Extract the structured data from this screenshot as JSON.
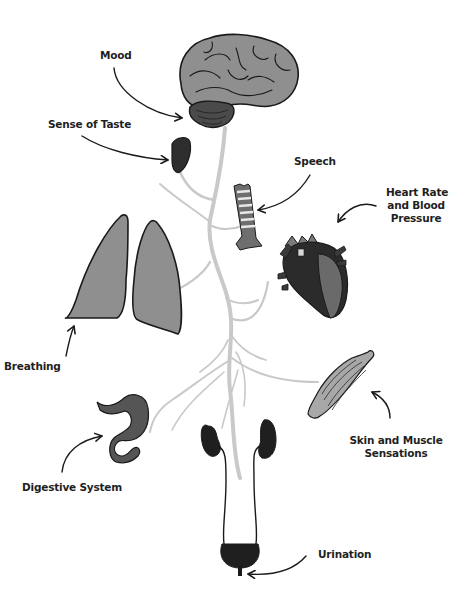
{
  "diagram": {
    "colors": {
      "background": "#ffffff",
      "nerve": "#c9c9c9",
      "organ_light": "#8f8f8f",
      "organ_mid": "#666666",
      "organ_dark": "#2e2e2e",
      "outline": "#1a1a1a",
      "label_text": "#1f1f1f"
    },
    "labels": {
      "mood": "Mood",
      "taste": "Sense of Taste",
      "speech": "Speech",
      "heart_line1": "Heart Rate",
      "heart_line2": "and Blood",
      "heart_line3": "Pressure",
      "breathing": "Breathing",
      "skin_line1": "Skin and Muscle",
      "skin_line2": "Sensations",
      "digestive": "Digestive System",
      "urination": "Urination"
    },
    "organs": [
      "brain",
      "tongue",
      "larynx",
      "heart",
      "lungs",
      "muscle",
      "stomach",
      "kidneys",
      "bladder"
    ]
  }
}
